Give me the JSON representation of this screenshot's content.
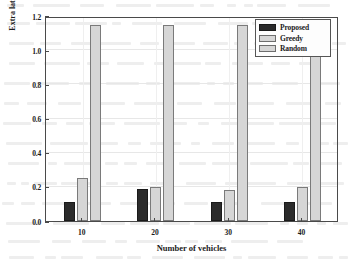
{
  "chart_data": {
    "type": "bar",
    "title": "",
    "xlabel": "Number of vehicles",
    "ylabel": "Extra latency cost",
    "categories": [
      "10",
      "20",
      "30",
      "40"
    ],
    "series": [
      {
        "name": "Proposed",
        "color": "#2b2b2b",
        "values": [
          0.11,
          0.19,
          0.11,
          0.11
        ]
      },
      {
        "name": "Greedy",
        "color": "#d6d6d6",
        "values": [
          0.25,
          0.2,
          0.18,
          0.2
        ]
      },
      {
        "name": "Random",
        "color": "#d6d6d6",
        "values": [
          1.145,
          1.145,
          1.145,
          1.145
        ]
      }
    ],
    "ylim": [
      0.0,
      1.2
    ],
    "ytick_labels": [
      "0.0",
      "0.2",
      "0.4",
      "0.6",
      "0.8",
      "1.0",
      "1.2"
    ],
    "ytick_values": [
      0.0,
      0.2,
      0.4,
      0.6,
      0.8,
      1.0,
      1.2
    ],
    "xtick_labels": [
      "10",
      "20",
      "30",
      "40"
    ],
    "grid": true,
    "legend_position": "top-right",
    "legend_entries": [
      "Proposed",
      "Greedy",
      "Random"
    ]
  },
  "legend": {
    "items": [
      {
        "label": "Proposed",
        "swatch": "proposed"
      },
      {
        "label": "Greedy",
        "swatch": "greedy"
      },
      {
        "label": "Random",
        "swatch": "random"
      }
    ]
  },
  "axes": {
    "y_title": "Extra latency cost",
    "x_title": "Number of vehicles"
  }
}
